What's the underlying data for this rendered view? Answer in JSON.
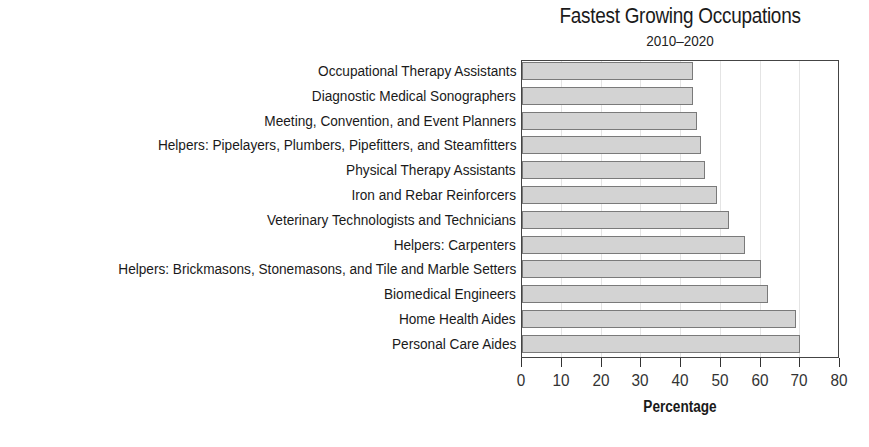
{
  "chart_data": {
    "type": "bar",
    "orientation": "horizontal",
    "title": "Fastest Growing Occupations",
    "subtitle": "2010–2020",
    "xlabel": "Percentage",
    "ylabel": "",
    "xlim": [
      0,
      80
    ],
    "xticks": [
      0,
      10,
      20,
      30,
      40,
      50,
      60,
      70,
      80
    ],
    "grid": true,
    "legend": null,
    "categories": [
      "Occupational Therapy Assistants",
      "Diagnostic Medical Sonographers",
      "Meeting, Convention, and Event Planners",
      "Helpers: Pipelayers, Plumbers, Pipefitters, and Steamfitters",
      "Physical Therapy Assistants",
      "Iron and Rebar Reinforcers",
      "Veterinary Technologists and Technicians",
      "Helpers: Carpenters",
      "Helpers: Brickmasons, Stonemasons, and Tile and Marble Setters",
      "Biomedical Engineers",
      "Home Health Aides",
      "Personal Care Aides"
    ],
    "values": [
      43,
      43,
      44,
      45,
      46,
      49,
      52,
      56,
      60,
      62,
      69,
      70
    ],
    "colors": {
      "bar_fill": "#d3d3d3",
      "bar_border": "#7a7a7a",
      "axis": "#444444",
      "grid": "#e4e4e4"
    }
  }
}
